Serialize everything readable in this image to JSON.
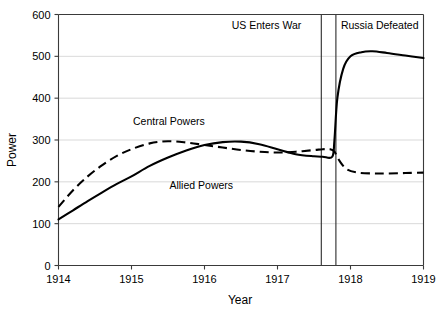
{
  "chart_data": {
    "type": "line",
    "title": "",
    "xlabel": "Year",
    "ylabel": "Power",
    "xlim": [
      1914,
      1919
    ],
    "ylim": [
      0,
      600
    ],
    "grid": true,
    "legend_position": "inline-annotations",
    "x_ticks": [
      "1914",
      "1915",
      "1916",
      "1917",
      "1918",
      "1919"
    ],
    "x_tick_values": [
      1914,
      1915,
      1916,
      1917,
      1918,
      1919
    ],
    "y_ticks": [
      "0",
      "100",
      "200",
      "300",
      "400",
      "500",
      "600"
    ],
    "y_tick_values": [
      0,
      100,
      200,
      300,
      400,
      500,
      600
    ],
    "series": [
      {
        "name": "Allied Powers",
        "style": "solid",
        "color": "#000000",
        "x": [
          1914.0,
          1914.2,
          1914.4,
          1914.6,
          1914.8,
          1915.0,
          1915.25,
          1915.5,
          1915.75,
          1916.0,
          1916.25,
          1916.5,
          1916.75,
          1917.0,
          1917.25,
          1917.5,
          1917.62,
          1917.75,
          1917.78,
          1917.82,
          1917.9,
          1918.0,
          1918.15,
          1918.3,
          1918.5,
          1918.75,
          1919.0
        ],
        "y": [
          110,
          132,
          154,
          175,
          195,
          213,
          238,
          258,
          275,
          288,
          295,
          296,
          290,
          278,
          266,
          261,
          260,
          260,
          300,
          400,
          470,
          500,
          510,
          512,
          508,
          502,
          496
        ]
      },
      {
        "name": "Central Powers",
        "style": "dashed",
        "color": "#000000",
        "x": [
          1914.0,
          1914.2,
          1914.4,
          1914.6,
          1914.8,
          1915.0,
          1915.25,
          1915.5,
          1915.75,
          1916.0,
          1916.25,
          1916.5,
          1916.75,
          1917.0,
          1917.25,
          1917.5,
          1917.62,
          1917.72,
          1917.78,
          1917.85,
          1917.95,
          1918.1,
          1918.3,
          1918.5,
          1918.75,
          1919.0
        ],
        "y": [
          140,
          180,
          213,
          240,
          262,
          278,
          292,
          297,
          294,
          288,
          282,
          276,
          272,
          270,
          272,
          276,
          278,
          278,
          272,
          250,
          230,
          222,
          220,
          220,
          221,
          222
        ]
      }
    ],
    "series_labels": [
      {
        "text": "Central Powers",
        "x": 1915.02,
        "y": 337
      },
      {
        "text": "Allied Powers",
        "x": 1915.52,
        "y": 182
      }
    ],
    "annotations": [
      {
        "text": "US Enters War",
        "line_x": 1917.6,
        "label_x": 1916.85,
        "label_y": 565
      },
      {
        "text": "Russia Defeated",
        "line_x": 1917.8,
        "label_x": 1918.4,
        "label_y": 565
      }
    ]
  }
}
